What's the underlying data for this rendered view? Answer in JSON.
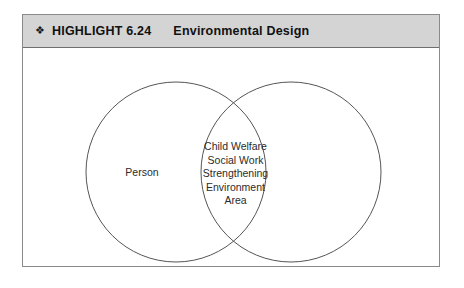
{
  "figure": {
    "header": {
      "bullet_icon": "floret-bullet-icon",
      "bullet_glyph": "❖",
      "label": "HIGHLIGHT  6.24",
      "title": "Environmental Design",
      "background_color": "#d4d4d4",
      "text_color": "#111111"
    },
    "diagram": {
      "type": "venn",
      "outline_color": "#555555",
      "fill_color": "#ffffff",
      "circles": [
        {
          "name": "left-circle",
          "label": "Person"
        },
        {
          "name": "right-circle",
          "label": ""
        }
      ],
      "intersection": {
        "name": "intersection-region",
        "lines": [
          "Child Welfare",
          "Social Work",
          "Strengthening",
          "Environment",
          "Area"
        ]
      }
    }
  }
}
